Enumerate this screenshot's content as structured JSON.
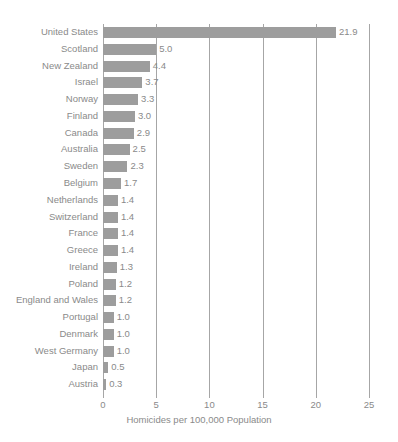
{
  "chart_data": {
    "type": "bar",
    "orientation": "horizontal",
    "title": "",
    "xlabel": "Homicides per 100,000 Population",
    "ylabel": "",
    "xlim": [
      0,
      25
    ],
    "xticks": [
      0,
      5,
      10,
      15,
      20,
      25
    ],
    "xtick_labels": [
      "0",
      "5",
      "10",
      "15",
      "20",
      "25"
    ],
    "grid": true,
    "grid_axis": "x",
    "legend": false,
    "bar_color": "#9d9d9d",
    "text_color": "#8a8a8a",
    "grid_color": "#a6a6a6",
    "categories": [
      "United States",
      "Scotland",
      "New Zealand",
      "Israel",
      "Norway",
      "Finland",
      "Canada",
      "Australia",
      "Sweden",
      "Belgium",
      "Netherlands",
      "Switzerland",
      "France",
      "Greece",
      "Ireland",
      "Poland",
      "England and Wales",
      "Portugal",
      "Denmark",
      "West Germany",
      "Japan",
      "Austria"
    ],
    "values": [
      21.9,
      5.0,
      4.4,
      3.7,
      3.3,
      3.0,
      2.9,
      2.5,
      2.3,
      1.7,
      1.4,
      1.4,
      1.4,
      1.4,
      1.3,
      1.2,
      1.2,
      1.0,
      1.0,
      1.0,
      0.5,
      0.3
    ],
    "value_labels": [
      "21.9",
      "5.0",
      "4.4",
      "3.7",
      "3.3",
      "3.0",
      "2.9",
      "2.5",
      "2.3",
      "1.7",
      "1.4",
      "1.4",
      "1.4",
      "1.4",
      "1.3",
      "1.2",
      "1.2",
      "1.0",
      "1.0",
      "1.0",
      "0.5",
      "0.3"
    ]
  }
}
